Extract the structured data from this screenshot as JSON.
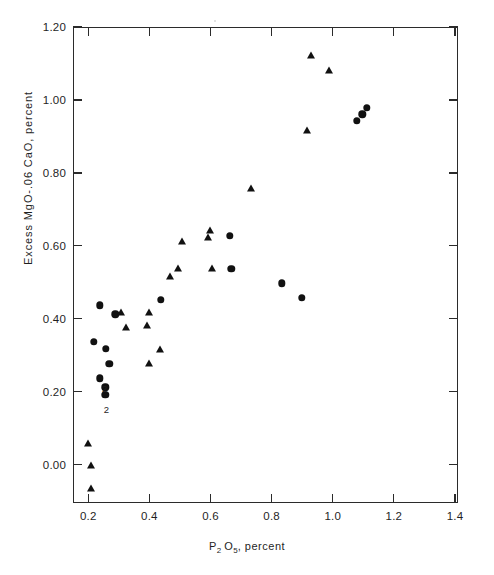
{
  "figure": {
    "type": "scatter-plot",
    "background": "#ffffff",
    "ink_color": "#111111"
  },
  "axes": {
    "x": {
      "title_main": "P",
      "title_sub1": "2",
      "title_main2": "O",
      "title_sub2": "5",
      "title_tail": ", percent",
      "ticks": [
        "0.2",
        "0.4",
        "0.6",
        "0.8",
        "1.0",
        "1.2",
        "1.4"
      ],
      "tick_values": [
        0.2,
        0.4,
        0.6,
        0.8,
        1.0,
        1.2,
        1.4
      ],
      "min": 0.15,
      "max": 1.41
    },
    "y": {
      "title": "Excess  MgO-.06 CaO, percent",
      "ticks": [
        "1.20",
        "1.00",
        "0.80",
        "0.60",
        "0.40",
        "0.20",
        "0.00"
      ],
      "tick_values": [
        1.2,
        1.0,
        0.8,
        0.6,
        0.4,
        0.2,
        0.0
      ],
      "min": -0.105,
      "max": 1.2
    }
  },
  "chart_data": {
    "type": "scatter",
    "title": "",
    "xlabel": "P2 O5, percent",
    "ylabel": "Excess MgO-.06 CaO, percent",
    "xlim": [
      0.15,
      1.41
    ],
    "ylim": [
      -0.105,
      1.2
    ],
    "grid": false,
    "legend": "none",
    "xticks": [
      0.2,
      0.4,
      0.6,
      0.8,
      1.0,
      1.2,
      1.4
    ],
    "yticks": [
      0.0,
      0.2,
      0.4,
      0.6,
      0.8,
      1.0,
      1.2
    ],
    "series": [
      {
        "name": "circles",
        "marker": "circle",
        "color": "#111111",
        "points": [
          [
            0.235,
            0.44
          ],
          [
            0.215,
            0.34
          ],
          [
            0.255,
            0.32
          ],
          [
            0.285,
            0.415
          ],
          [
            0.265,
            0.28
          ],
          [
            0.235,
            0.24
          ],
          [
            0.253,
            0.215
          ],
          [
            0.253,
            0.195
          ],
          [
            0.435,
            0.455
          ],
          [
            0.665,
            0.54
          ],
          [
            0.66,
            0.63
          ],
          [
            0.83,
            0.5
          ],
          [
            0.895,
            0.46
          ],
          [
            1.075,
            0.945
          ],
          [
            1.093,
            0.963
          ],
          [
            1.108,
            0.982
          ]
        ]
      },
      {
        "name": "triangles",
        "marker": "triangle",
        "color": "#111111",
        "points": [
          [
            0.195,
            0.06
          ],
          [
            0.205,
            0.0
          ],
          [
            0.205,
            -0.062
          ],
          [
            0.32,
            0.38
          ],
          [
            0.305,
            0.42
          ],
          [
            0.395,
            0.42
          ],
          [
            0.39,
            0.385
          ],
          [
            0.43,
            0.32
          ],
          [
            0.395,
            0.28
          ],
          [
            0.465,
            0.52
          ],
          [
            0.49,
            0.54
          ],
          [
            0.505,
            0.615
          ],
          [
            0.6,
            0.54
          ],
          [
            0.59,
            0.625
          ],
          [
            0.595,
            0.645
          ],
          [
            0.728,
            0.76
          ],
          [
            0.925,
            1.125
          ],
          [
            0.985,
            1.085
          ],
          [
            0.912,
            0.92
          ]
        ]
      }
    ],
    "point_annotations": [
      {
        "text": "2",
        "x": 0.25,
        "y": 0.213
      },
      {
        "text": "2",
        "x": 0.256,
        "y": 0.155
      }
    ]
  }
}
